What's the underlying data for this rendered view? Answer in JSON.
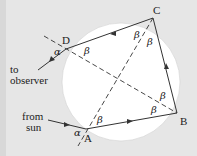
{
  "diagram": {
    "points": {
      "A": "A",
      "B": "B",
      "C": "C",
      "D": "D"
    },
    "labels": {
      "to_observer_1": "to",
      "to_observer_2": "observer",
      "from_sun_1": "from",
      "from_sun_2": "sun"
    },
    "angles": {
      "alpha": "α",
      "beta": "β"
    },
    "colors": {
      "background": "#e6e6e6",
      "circle": "#ffffff",
      "line": "#333333"
    }
  }
}
